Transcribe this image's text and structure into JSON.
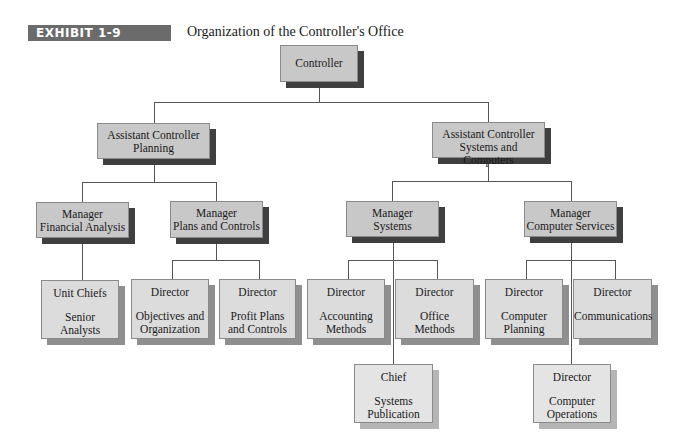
{
  "header": {
    "exhibit_label": "EXHIBIT 1-9",
    "title": "Organization of the Controller's Office"
  },
  "colors": {
    "badge_bg": "#6b6b6b",
    "box_fill_top": "#c8c8c8",
    "box_fill_director": "#dcdcdc",
    "box_fill_bottom": "#e4e4e4",
    "shadow_dark": "#3f3f3f",
    "connector": "#555555"
  },
  "org": {
    "controller": {
      "line1": "Controller"
    },
    "ac_planning": {
      "line1": "Assistant Controller",
      "line2": "Planning"
    },
    "ac_systems": {
      "line1": "Assistant Controller",
      "line2": "Systems and Computers"
    },
    "mgr_financial": {
      "line1": "Manager",
      "line2": "Financial Analysis"
    },
    "mgr_plans": {
      "line1": "Manager",
      "line2": "Plans and Controls"
    },
    "mgr_systems": {
      "line1": "Manager",
      "line2": "Systems"
    },
    "mgr_computer": {
      "line1": "Manager",
      "line2": "Computer Services"
    },
    "unit_chiefs": {
      "title": "Unit Chiefs",
      "line1": "Senior",
      "line2": "Analysts"
    },
    "dir_objectives": {
      "title": "Director",
      "line1": "Objectives and",
      "line2": "Organization"
    },
    "dir_profit": {
      "title": "Director",
      "line1": "Profit Plans",
      "line2": "and Controls"
    },
    "dir_accounting": {
      "title": "Director",
      "line1": "Accounting",
      "line2": "Methods"
    },
    "dir_office": {
      "title": "Director",
      "line1": "Office",
      "line2": "Methods"
    },
    "dir_planning": {
      "title": "Director",
      "line1": "Computer",
      "line2": "Planning"
    },
    "dir_communications": {
      "title": "Director",
      "line1": "Communications"
    },
    "chief_publication": {
      "title": "Chief",
      "line1": "Systems",
      "line2": "Publication"
    },
    "dir_operations": {
      "title": "Director",
      "line1": "Computer",
      "line2": "Operations"
    }
  }
}
